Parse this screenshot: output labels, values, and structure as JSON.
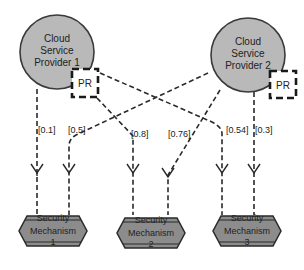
{
  "diagram": {
    "colors": {
      "provider_fill": "#b9b9b9",
      "provider_stroke": "#3a3a3a",
      "mechanism_fill": "#8c8c8c",
      "mechanism_stroke": "#2a2a2a",
      "line": "#2a2a2a"
    },
    "providers": [
      {
        "id": "csp1",
        "line1": "Cloud",
        "line2": "Service",
        "line3": "Provider 1",
        "pr_label": "PR"
      },
      {
        "id": "csp2",
        "line1": "Cloud",
        "line2": "Service",
        "line3": "Provider 2",
        "pr_label": "PR"
      }
    ],
    "mechanisms": [
      {
        "id": "sm1",
        "line1": "Security",
        "line2": "Mechanism",
        "line3": "1"
      },
      {
        "id": "sm2",
        "line1": "Security",
        "line2": "Mechanism",
        "line3": "2"
      },
      {
        "id": "sm3",
        "line1": "Security",
        "line2": "Mechanism",
        "line3": "3"
      }
    ],
    "edges": [
      {
        "from": "Cloud Service Provider 1",
        "to": "Security Mechanism 1",
        "label": "[0.1]"
      },
      {
        "from": "Cloud Service Provider 2",
        "to": "Security Mechanism 1",
        "label": "[0.5]"
      },
      {
        "from": "Cloud Service Provider 1",
        "to": "Security Mechanism 2",
        "label": "[0.8]"
      },
      {
        "from": "Cloud Service Provider 2",
        "to": "Security Mechanism 2",
        "label": "[0.76]"
      },
      {
        "from": "Cloud Service Provider 1",
        "to": "Security Mechanism 3",
        "label": "[0.54]"
      },
      {
        "from": "Cloud Service Provider 2",
        "to": "Security Mechanism 3",
        "label": "[0.3]"
      }
    ]
  }
}
